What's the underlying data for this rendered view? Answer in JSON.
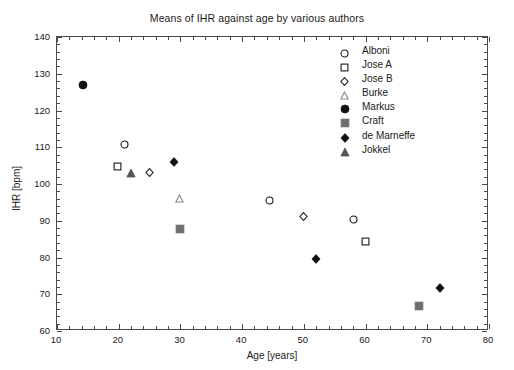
{
  "chart_data": {
    "type": "scatter",
    "title": "Means of IHR against age by various authors",
    "xlabel": "Age [years]",
    "ylabel": "IHR [bpm]",
    "xlim": [
      10,
      80
    ],
    "ylim": [
      60,
      140
    ],
    "xticks": [
      10,
      20,
      30,
      40,
      50,
      60,
      70,
      80
    ],
    "yticks": [
      60,
      70,
      80,
      90,
      100,
      110,
      120,
      130,
      140
    ],
    "xtick_minor_step": 2,
    "ytick_minor_step": 2,
    "grid": false,
    "legend_position": "upper right",
    "series": [
      {
        "name": "Alboni",
        "marker": "open-circle",
        "color": "#1a1a1a",
        "fill": "none",
        "points": [
          {
            "x": 21.0,
            "y": 112.0
          },
          {
            "x": 44.4,
            "y": 96.8
          },
          {
            "x": 58.0,
            "y": 91.6
          }
        ]
      },
      {
        "name": "Jose A",
        "marker": "open-square",
        "color": "#1a1a1a",
        "fill": "none",
        "points": [
          {
            "x": 19.8,
            "y": 106.0
          },
          {
            "x": 60.0,
            "y": 85.6
          }
        ]
      },
      {
        "name": "Jose B",
        "marker": "open-diamond",
        "color": "#1a1a1a",
        "fill": "none",
        "points": [
          {
            "x": 25.0,
            "y": 104.5
          },
          {
            "x": 50.0,
            "y": 92.4
          }
        ]
      },
      {
        "name": "Burke",
        "marker": "open-triangle",
        "color": "#8a8a8a",
        "fill": "none",
        "points": [
          {
            "x": 29.8,
            "y": 97.5
          }
        ]
      },
      {
        "name": "Markus",
        "marker": "filled-circle",
        "color": "#111111",
        "fill": "#111111",
        "points": [
          {
            "x": 14.2,
            "y": 128.0
          }
        ]
      },
      {
        "name": "Craft",
        "marker": "filled-square",
        "color": "#6e6e6e",
        "fill": "#6e6e6e",
        "points": [
          {
            "x": 30.0,
            "y": 88.8
          },
          {
            "x": 68.7,
            "y": 67.8
          }
        ]
      },
      {
        "name": "de Marneffe",
        "marker": "filled-diamond",
        "color": "#111111",
        "fill": "#111111",
        "points": [
          {
            "x": 29.0,
            "y": 107.2
          },
          {
            "x": 52.0,
            "y": 80.8
          },
          {
            "x": 72.0,
            "y": 72.8
          }
        ]
      },
      {
        "name": "Jokkel",
        "marker": "filled-triangle",
        "color": "#555555",
        "fill": "#555555",
        "points": [
          {
            "x": 22.0,
            "y": 104.0
          }
        ]
      }
    ]
  },
  "title": "Means of IHR against age by various authors",
  "axes": {
    "x_title": "Age [years]",
    "y_title": "IHR [bpm]",
    "x_ticks": [
      "10",
      "20",
      "30",
      "40",
      "50",
      "60",
      "70",
      "80"
    ],
    "y_ticks": [
      "140",
      "130",
      "120",
      "110",
      "100",
      "90",
      "80",
      "70",
      "60"
    ]
  },
  "legend": {
    "items": [
      {
        "label": "Alboni",
        "marker": "open-circle-icon"
      },
      {
        "label": "Jose A",
        "marker": "open-square-icon"
      },
      {
        "label": "Jose B",
        "marker": "open-diamond-icon"
      },
      {
        "label": "Burke",
        "marker": "open-triangle-icon"
      },
      {
        "label": "Markus",
        "marker": "filled-circle-icon"
      },
      {
        "label": "Craft",
        "marker": "filled-square-icon"
      },
      {
        "label": "de Marneffe",
        "marker": "filled-diamond-icon"
      },
      {
        "label": "Jokkel",
        "marker": "filled-triangle-icon"
      }
    ]
  },
  "colors": {
    "axis": "#4a4a4a",
    "text": "#1a1a1a",
    "black_marker": "#111111",
    "gray_marker": "#6e6e6e",
    "light_gray_marker": "#8a8a8a"
  }
}
